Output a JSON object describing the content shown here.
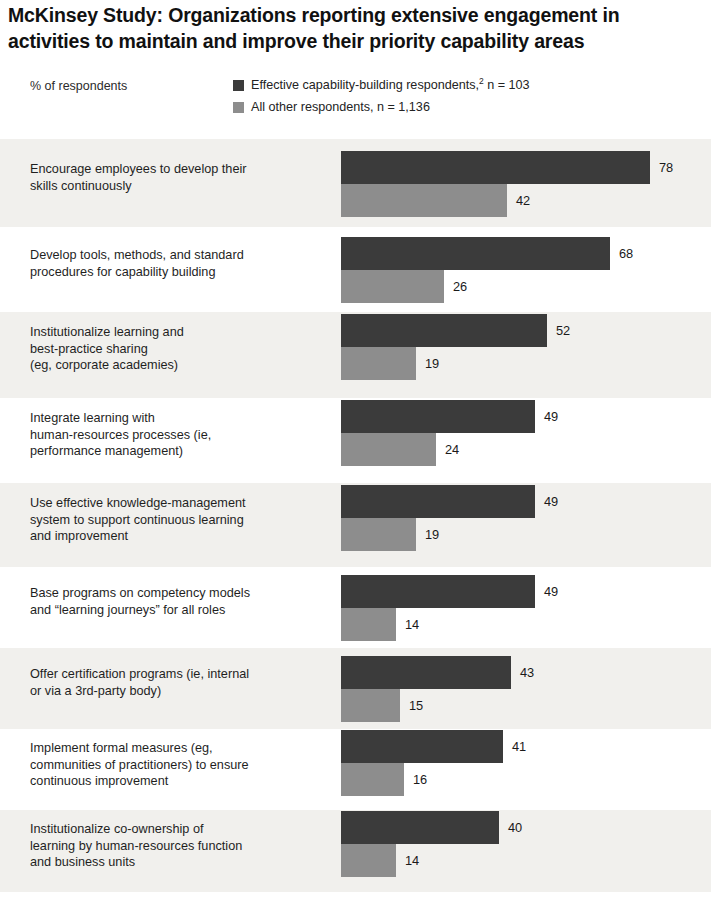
{
  "title": "McKinsey Study: Organizations reporting extensive engagement in activities to maintain and improve their priority capability areas",
  "axis_note": "% of respondents",
  "legend": {
    "items": [
      {
        "label": "Effective capability-building respondents,",
        "superscript": "2",
        "suffix": " n = 103",
        "color": "#3b3b3b",
        "swatch_name": "legend-swatch-primary"
      },
      {
        "label": "All other respondents, n = 1,136",
        "superscript": "",
        "suffix": "",
        "color": "#8d8d8d",
        "swatch_name": "legend-swatch-secondary"
      }
    ]
  },
  "colors": {
    "primary_bar": "#3b3b3b",
    "secondary_bar": "#8d8d8d",
    "row_band": "#f1f0ed",
    "background": "#ffffff",
    "text": "#1a1a1a"
  },
  "chart_data": {
    "type": "bar",
    "orientation": "horizontal",
    "title": "McKinsey Study: Organizations reporting extensive engagement in activities to maintain and improve their priority capability areas",
    "xlabel": "% of respondents",
    "ylabel": "",
    "xlim": [
      0,
      80
    ],
    "grid": false,
    "legend_position": "top-right",
    "categories": [
      "Encourage employees to develop their skills continuously",
      "Develop tools, methods, and standard procedures for capability building",
      "Institutionalize learning and best-practice sharing (eg, corporate academies)",
      "Integrate learning with human-resources processes (ie, performance management)",
      "Use effective knowledge-management system to support continuous learning and improvement",
      "Base programs on competency models and “learning journeys” for all roles",
      "Offer certification programs (ie, internal or via a 3rd-party body)",
      "Implement formal measures (eg, communities of practitioners) to ensure continuous improvement",
      "Institutionalize co-ownership of learning by human-resources function and business units"
    ],
    "series": [
      {
        "name": "Effective capability-building respondents, n = 103",
        "color": "#3b3b3b",
        "values": [
          78,
          68,
          52,
          49,
          49,
          49,
          43,
          41,
          40
        ]
      },
      {
        "name": "All other respondents, n = 1,136",
        "color": "#8d8d8d",
        "values": [
          42,
          26,
          19,
          24,
          19,
          14,
          15,
          16,
          14
        ]
      }
    ]
  },
  "rows": [
    {
      "label_lines": [
        "Encourage employees to develop their",
        "skills continuously"
      ],
      "primary": 78,
      "secondary": 42,
      "banded": true,
      "height": 88,
      "label_top": 22
    },
    {
      "label_lines": [
        "Develop tools, methods, and standard",
        "procedures for capability building"
      ],
      "primary": 68,
      "secondary": 26,
      "banded": false,
      "height": 85,
      "label_top": 20
    },
    {
      "label_lines": [
        "Institutionalize learning and",
        "best-practice sharing",
        "(eg, corporate academies)"
      ],
      "primary": 52,
      "secondary": 19,
      "banded": true,
      "height": 86,
      "label_top": 12
    },
    {
      "label_lines": [
        "Integrate learning with",
        "human-resources processes (ie,",
        "performance management)"
      ],
      "primary": 49,
      "secondary": 24,
      "banded": false,
      "height": 85,
      "label_top": 12
    },
    {
      "label_lines": [
        "Use effective knowledge-management",
        "system to support continuous learning",
        "and improvement"
      ],
      "primary": 49,
      "secondary": 19,
      "banded": true,
      "height": 84,
      "label_top": 12
    },
    {
      "label_lines": [
        "Base programs on competency models",
        "and “learning journeys” for all roles"
      ],
      "primary": 49,
      "secondary": 14,
      "banded": false,
      "height": 81,
      "label_top": 18
    },
    {
      "label_lines": [
        "Offer certification programs (ie, internal",
        "or via a 3rd-party body)"
      ],
      "primary": 43,
      "secondary": 15,
      "banded": true,
      "height": 81,
      "label_top": 18
    },
    {
      "label_lines": [
        "Implement formal measures (eg,",
        "communities of practitioners) to ensure",
        "continuous improvement"
      ],
      "primary": 41,
      "secondary": 16,
      "banded": false,
      "height": 81,
      "label_top": 11
    },
    {
      "label_lines": [
        "Institutionalize co-ownership of",
        "learning by human-resources function",
        "and business units"
      ],
      "primary": 40,
      "secondary": 14,
      "banded": true,
      "height": 82,
      "label_top": 11
    }
  ],
  "scale": {
    "px_per_unit": 3.96,
    "bar_origin_x": 341
  }
}
